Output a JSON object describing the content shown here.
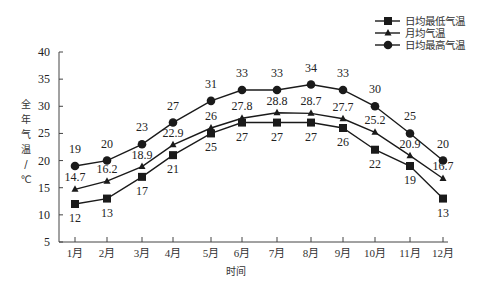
{
  "chart_data": {
    "type": "line",
    "title": "",
    "xlabel": "时间",
    "ylabel": "全年气温/℃",
    "ylabel_chars": [
      "全",
      "年",
      "气",
      "温",
      "/",
      "℃"
    ],
    "ylim": [
      5,
      40
    ],
    "yticks": [
      5,
      10,
      15,
      20,
      25,
      30,
      35,
      40
    ],
    "grid": false,
    "legend_position": "top-right",
    "categories": [
      "1月",
      "2月",
      "3月",
      "4月",
      "5月",
      "6月",
      "7月",
      "8月",
      "9月",
      "10月",
      "11月",
      "12月"
    ],
    "series": [
      {
        "name": "日均最低气温",
        "marker": "square",
        "values": [
          12,
          13,
          17,
          21,
          25,
          27,
          27,
          27,
          26,
          22,
          19,
          13
        ],
        "labels": [
          "12",
          "13",
          "17",
          "21",
          "25",
          "27",
          "27",
          "27",
          "26",
          "22",
          "19",
          "13"
        ],
        "label_position": "below"
      },
      {
        "name": "月均气温",
        "marker": "triangle",
        "values": [
          14.7,
          16.2,
          18.9,
          22.9,
          26,
          27.8,
          28.8,
          28.7,
          27.7,
          25.2,
          20.9,
          16.7
        ],
        "labels": [
          "14.7",
          "16.2",
          "18.9",
          "22.9",
          "26",
          "27.8",
          "28.8",
          "28.7",
          "27.7",
          "25.2",
          "20.9",
          "16.7"
        ],
        "label_position": "above"
      },
      {
        "name": "日均最高气温",
        "marker": "circle",
        "values": [
          19,
          20,
          23,
          27,
          31,
          33,
          33,
          34,
          33,
          30,
          25,
          20
        ],
        "labels": [
          "19",
          "20",
          "23",
          "27",
          "31",
          "33",
          "33",
          "34",
          "33",
          "30",
          "25",
          "20"
        ],
        "label_position": "above"
      }
    ]
  },
  "colors": {
    "line": "#1a1a1a",
    "text": "#222222",
    "background": "#ffffff"
  }
}
